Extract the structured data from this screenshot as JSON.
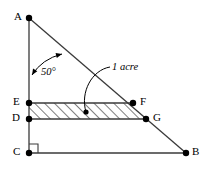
{
  "figure": {
    "type": "geometry-diagram",
    "width": 208,
    "height": 173,
    "background_color": "#ffffff",
    "line_color": "#3a3a3a",
    "label_color": "#000000",
    "hatch_color": "#000000"
  },
  "points": [
    {
      "id": "A",
      "label": "A",
      "x": 29,
      "y": 18,
      "label_x": 14,
      "label_y": 11
    },
    {
      "id": "E",
      "label": "E",
      "x": 29,
      "y": 103,
      "label_x": 13,
      "label_y": 96
    },
    {
      "id": "D",
      "label": "D",
      "x": 29,
      "y": 119,
      "label_x": 12,
      "label_y": 112
    },
    {
      "id": "C",
      "label": "C",
      "x": 29,
      "y": 153,
      "label_x": 13,
      "label_y": 146
    },
    {
      "id": "F",
      "label": "F",
      "x": 133,
      "y": 103,
      "label_x": 140,
      "label_y": 96
    },
    {
      "id": "G",
      "label": "G",
      "x": 146,
      "y": 119,
      "label_x": 153,
      "label_y": 112
    },
    {
      "id": "B",
      "label": "B",
      "x": 186,
      "y": 153,
      "label_x": 192,
      "label_y": 146
    }
  ],
  "segments": [
    {
      "name": "side-AC",
      "from": "A",
      "to": "C"
    },
    {
      "name": "side-CB",
      "from": "C",
      "to": "B"
    },
    {
      "name": "hypotenuse-AB",
      "from": "A",
      "to": "B"
    },
    {
      "name": "segment-EF",
      "from": "E",
      "to": "F"
    },
    {
      "name": "segment-DG",
      "from": "D",
      "to": "G"
    }
  ],
  "region": {
    "name": "hatched-parallelogram",
    "vertices": "E,F,G,D",
    "fill_pattern": "diagonal-hatch",
    "marker_point": {
      "x": 86,
      "y": 112
    }
  },
  "angle": {
    "label": "50°",
    "vertex": "A",
    "label_x": 41,
    "label_y": 67,
    "arc_start": {
      "x": 32,
      "y": 75
    },
    "arc_end": {
      "x": 62,
      "y": 54
    },
    "arc_control": {
      "x": 42,
      "y": 59
    }
  },
  "annotation": {
    "label": "1 acre",
    "label_x": 112,
    "label_y": 62,
    "leader_start": {
      "x": 110,
      "y": 67
    },
    "leader_end": {
      "x": 86,
      "y": 112
    },
    "leader_control1": {
      "x": 92,
      "y": 70
    },
    "leader_control2": {
      "x": 80,
      "y": 92
    }
  },
  "right_angle_marker": {
    "name": "right-angle-at-C",
    "x": 29,
    "y": 153,
    "size": 9
  }
}
